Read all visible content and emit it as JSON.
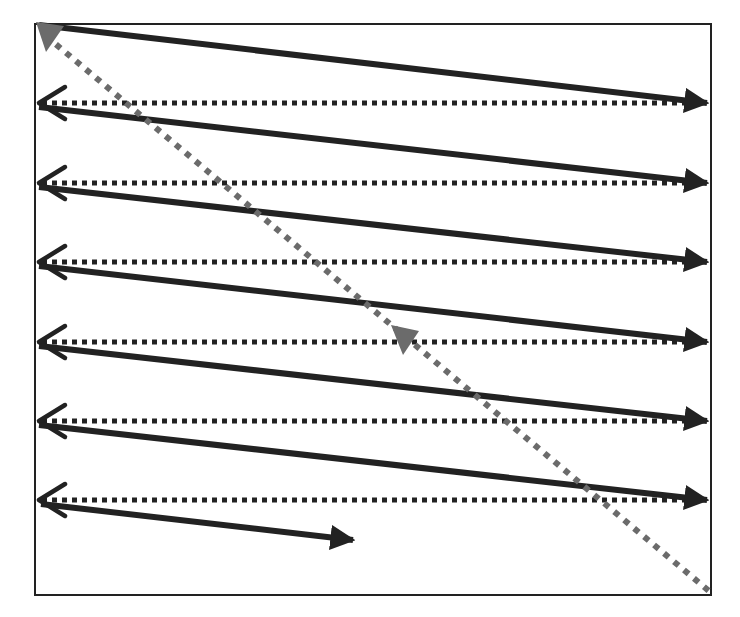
{
  "diagram": {
    "type": "raster-scan-order",
    "colors": {
      "background": "#ffffff",
      "frame": "#222222",
      "solid_arrow": "#222222",
      "dotted_return": "#222222",
      "diagonal": "#6b6b6b"
    },
    "frame": {
      "x": 35,
      "y": 24,
      "width": 676,
      "height": 571
    },
    "rows_y": [
      24,
      103,
      183,
      262,
      342,
      421,
      500
    ],
    "final_arrow_end": {
      "x": 353,
      "y": 540
    },
    "diagonal": {
      "start": {
        "x": 38,
        "y": 28
      },
      "end": {
        "x": 709,
        "y": 591
      },
      "mid_arrowhead": {
        "x": 405,
        "y": 345
      }
    }
  }
}
